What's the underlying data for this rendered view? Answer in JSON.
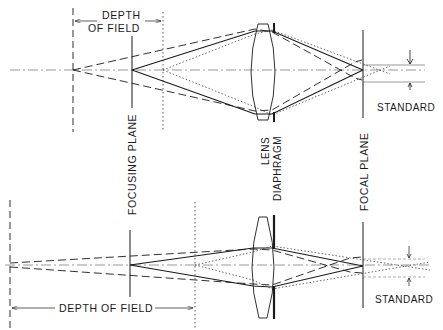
{
  "diagram": {
    "title": "",
    "top_panel": {
      "depth_of_field_line1": "DEPTH",
      "depth_of_field_line2": "OF FIELD",
      "standard_label": "STANDARD",
      "aperture": "wide"
    },
    "bottom_panel": {
      "depth_of_field_label": "DEPTH OF FIELD",
      "standard_label": "STANDARD",
      "aperture": "narrow"
    },
    "vertical_labels": {
      "focusing_plane": "FOCUSING PLANE",
      "lens": "LENS",
      "diaphragm": "DIAPHRAGM",
      "focal_plane": "FOCAL PLANE"
    },
    "colors": {
      "ink": "#1a1a1a",
      "background": "#ffffff"
    }
  }
}
